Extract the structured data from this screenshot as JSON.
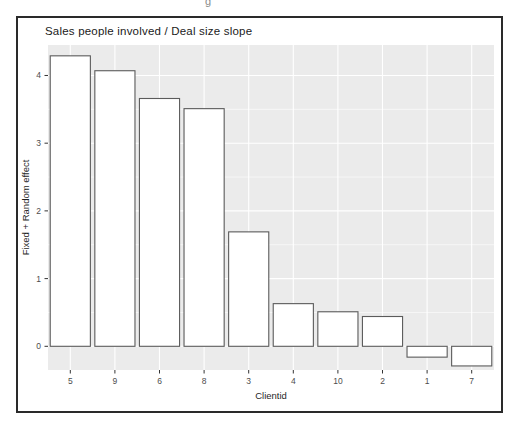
{
  "figure": {
    "cropped_fragment": "g"
  },
  "chart_data": {
    "type": "bar",
    "title": "Sales people involved / Deal size slope",
    "xlabel": "Clientid",
    "ylabel": "Fixed + Random effect",
    "categories": [
      "5",
      "9",
      "6",
      "8",
      "3",
      "4",
      "10",
      "2",
      "1",
      "7"
    ],
    "values": [
      4.29,
      4.07,
      3.66,
      3.51,
      1.69,
      0.63,
      0.51,
      0.44,
      -0.16,
      -0.29
    ],
    "yticks": [
      0,
      1,
      2,
      3,
      4
    ],
    "yticks_minor": [
      0.5,
      1.5,
      2.5,
      3.5
    ],
    "ylim": [
      -0.35,
      4.45
    ],
    "legend": "none",
    "grid": "horizontal major+minor, vertical major at category centers",
    "colors": {
      "panel_bg": "#ebebeb",
      "grid": "#ffffff",
      "bar_fill": "#ffffff",
      "bar_stroke": "#5b5b5b",
      "tick_label": "#4d4d4d",
      "axis_title": "#1f1f1f",
      "title": "#1a1a1a",
      "frame_border": "#2a2a2a",
      "tick_mark": "#333333"
    }
  }
}
